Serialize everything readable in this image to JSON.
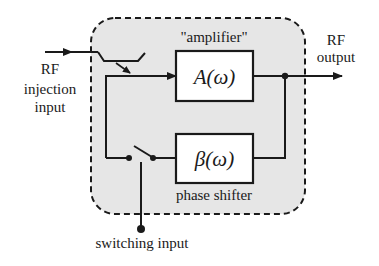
{
  "diagram": {
    "enclosure_label": "\"amplifier\"",
    "blocks": {
      "amplifier": {
        "label": "A(ω)"
      },
      "phase_shifter": {
        "label": "β(ω)",
        "caption": "phase shifter"
      }
    },
    "ports": {
      "input": {
        "lines": [
          "RF",
          "injection",
          "input"
        ]
      },
      "output": {
        "lines": [
          "RF",
          "output"
        ]
      },
      "switching": {
        "label": "switching input"
      }
    },
    "colors": {
      "enclosure_fill": "#e6e6e6",
      "line": "#1a1a1a",
      "block_fill": "#ffffff"
    }
  }
}
